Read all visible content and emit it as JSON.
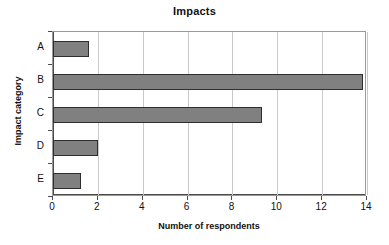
{
  "chart_data": {
    "type": "bar",
    "orientation": "horizontal",
    "title": "Impacts",
    "xlabel": "Number of respondents",
    "ylabel": "Impact category",
    "categories": [
      "A",
      "B",
      "C",
      "D",
      "E"
    ],
    "values": [
      1.6,
      13.8,
      9.3,
      2.0,
      1.25
    ],
    "xlim": [
      0,
      14
    ],
    "xticks": [
      0,
      2,
      4,
      6,
      8,
      10,
      12,
      14
    ],
    "xtick_labels": [
      "0",
      "2",
      "4",
      "6",
      "8",
      "10",
      "12",
      "14"
    ],
    "grid": "vertical",
    "legend": "none",
    "series": [
      {
        "name": "Number of respondents",
        "values": [
          1.6,
          13.8,
          9.3,
          2.0,
          1.25
        ]
      }
    ],
    "colors": {
      "bar_fill": "#808080",
      "bar_border": "#2e2e2e",
      "gridline": "#c9c9c9",
      "axis": "#4a4a4a",
      "plot_border": "#9a9a9a",
      "background": "#ffffff",
      "text": "#111111"
    }
  }
}
